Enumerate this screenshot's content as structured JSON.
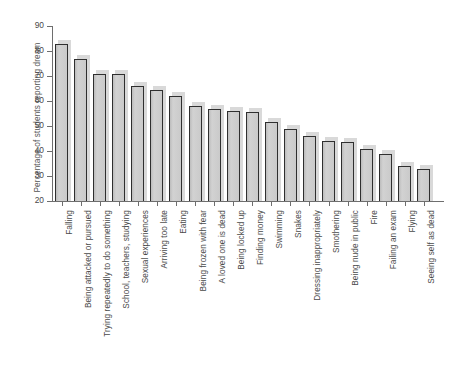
{
  "chart_data": {
    "type": "bar",
    "title": "",
    "subtitle": "",
    "xlabel": "",
    "ylabel": "Percentage of students reporting dream",
    "ylim": [
      20,
      90
    ],
    "ytick_values": [
      20,
      30,
      40,
      50,
      60,
      70,
      80,
      90
    ],
    "ytick_labels": [
      "20",
      "30",
      "40",
      "50",
      "60",
      "70",
      "80",
      "90"
    ],
    "grid": false,
    "legend": "none",
    "bar_color": "#c9c9c9",
    "bar_edge_color": "#2f2f2f",
    "bar_shadow_color": "#d9d9d9",
    "axis_color": "#6e6e6e",
    "categories": [
      "Falling",
      "Being attacked or pursued",
      "Trying repeatedly to do something",
      "School, teachers, studying",
      "Sexual experiences",
      "Arriving too late",
      "Eating",
      "Being frozen with fear",
      "A loved one is dead",
      "Being locked up",
      "Finding money",
      "Swimming",
      "Snakes",
      "Dressing inappropriately",
      "Smothering",
      "Being nude in public",
      "Fire",
      "Failing an exam",
      "Flying",
      "Seeing self as dead"
    ],
    "values": [
      83,
      77,
      71,
      71,
      66,
      64.5,
      62,
      58,
      57,
      56,
      55.5,
      51.5,
      49,
      46,
      44,
      43.5,
      41,
      39,
      34,
      33
    ]
  }
}
